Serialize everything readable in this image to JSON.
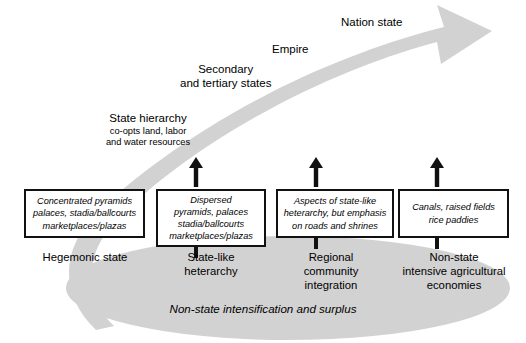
{
  "diagram": {
    "colors": {
      "swoosh_gray": "#d2d2d2",
      "ellipse_gray": "#d2d2d2",
      "box_border": "#111111",
      "text": "#000000",
      "background": "#ffffff"
    },
    "curve_labels": [
      {
        "id": "state-hierarchy",
        "main": "State hierarchy",
        "sub_line_1": "co-opts land, labor",
        "sub_line_2": "and water resources"
      },
      {
        "id": "secondary-tertiary",
        "line_1": "Secondary",
        "line_2": "and tertiary states"
      },
      {
        "id": "empire",
        "text": "Empire"
      },
      {
        "id": "nation-state",
        "text": "Nation state"
      }
    ],
    "boxes": [
      {
        "id": "hegemonic-state",
        "lines": [
          "Concentrated pyramids",
          "palaces, stadia/ballcourts",
          "marketplaces/plazas"
        ],
        "caption_lines": [
          "Hegemonic state"
        ],
        "has_up_arrow": false,
        "has_stub": false
      },
      {
        "id": "state-like-heterarchy",
        "lines": [
          "Dispersed",
          "pyramids, palaces",
          "stadia/ballcourts",
          "marketplaces/plazas"
        ],
        "caption_lines": [
          "State-like",
          "heterarchy"
        ],
        "has_up_arrow": true,
        "has_stub": true
      },
      {
        "id": "regional-community-integration",
        "lines": [
          "Aspects of state-like",
          "heterarchy, but emphasis",
          "on roads and shrines"
        ],
        "caption_lines": [
          "Regional",
          "community",
          "integration"
        ],
        "has_up_arrow": true,
        "has_stub": true
      },
      {
        "id": "non-state-intensive-agricultural-economies",
        "lines": [
          "Canals, raised fields",
          "rice paddies"
        ],
        "caption_lines": [
          "Non-state",
          "intensive agricultural",
          "economies"
        ],
        "has_up_arrow": true,
        "has_stub": true
      }
    ],
    "ellipse_caption": "Non-state intensification and surplus"
  }
}
